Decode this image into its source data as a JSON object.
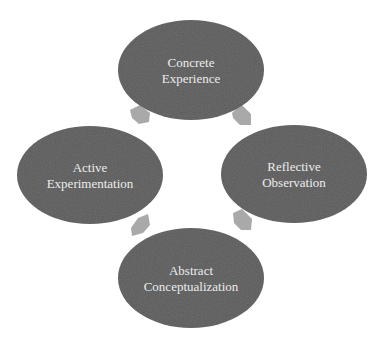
{
  "diagram": {
    "type": "cycle",
    "colors": {
      "node_fill": "#5b5b5b",
      "node_text": "#ececec",
      "arrow_fill": "#a9a9a9",
      "background": "#ffffff"
    },
    "nodes": [
      {
        "id": "concrete-experience",
        "lines": [
          "Concrete",
          "Experience"
        ]
      },
      {
        "id": "reflective-observation",
        "lines": [
          "Reflective",
          "Observation"
        ]
      },
      {
        "id": "abstract-conceptualization",
        "lines": [
          "Abstract",
          "Conceptualization"
        ]
      },
      {
        "id": "active-experimentation",
        "lines": [
          "Active",
          "Experimentation"
        ]
      }
    ],
    "edges": [
      {
        "from": "concrete-experience",
        "to": "reflective-observation"
      },
      {
        "from": "reflective-observation",
        "to": "abstract-conceptualization"
      },
      {
        "from": "abstract-conceptualization",
        "to": "active-experimentation"
      },
      {
        "from": "active-experimentation",
        "to": "concrete-experience"
      }
    ]
  }
}
